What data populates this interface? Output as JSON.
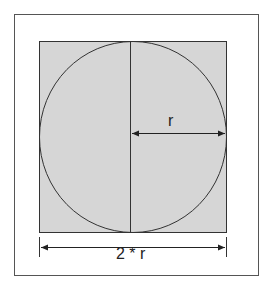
{
  "diagram": {
    "radius_label": "r",
    "diameter_label": "2 * r",
    "colors": {
      "background": "#ffffff",
      "square_fill": "#d6d6d6",
      "stroke": "#333333",
      "frame": "#555555"
    }
  }
}
